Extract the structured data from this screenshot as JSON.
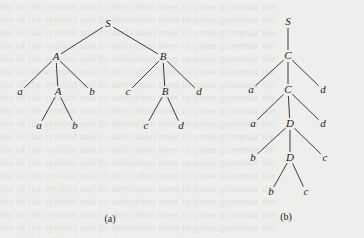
{
  "figure": {
    "trees": [
      {
        "id": "a",
        "caption": "(a)",
        "caption_pos": [
          110,
          213
        ],
        "nodes": [
          {
            "label": "S",
            "x": 108,
            "y": 24
          },
          {
            "label": "A",
            "x": 56,
            "y": 57
          },
          {
            "label": "B",
            "x": 163,
            "y": 57
          },
          {
            "label": "a",
            "x": 20,
            "y": 92
          },
          {
            "label": "A",
            "x": 58,
            "y": 92
          },
          {
            "label": "b",
            "x": 92,
            "y": 92
          },
          {
            "label": "c",
            "x": 128,
            "y": 92
          },
          {
            "label": "B",
            "x": 165,
            "y": 92
          },
          {
            "label": "d",
            "x": 199,
            "y": 92
          },
          {
            "label": "a",
            "x": 39,
            "y": 126
          },
          {
            "label": "b",
            "x": 75,
            "y": 126
          },
          {
            "label": "c",
            "x": 146,
            "y": 126
          },
          {
            "label": "d",
            "x": 181,
            "y": 126
          }
        ],
        "edges": [
          [
            0,
            1
          ],
          [
            0,
            2
          ],
          [
            1,
            3
          ],
          [
            1,
            4
          ],
          [
            1,
            5
          ],
          [
            2,
            6
          ],
          [
            2,
            7
          ],
          [
            2,
            8
          ],
          [
            4,
            9
          ],
          [
            4,
            10
          ],
          [
            7,
            11
          ],
          [
            7,
            12
          ]
        ]
      },
      {
        "id": "b",
        "caption": "(b)",
        "caption_pos": [
          286,
          211
        ],
        "nodes": [
          {
            "label": "S",
            "x": 288,
            "y": 22
          },
          {
            "label": "C",
            "x": 288,
            "y": 56
          },
          {
            "label": "a",
            "x": 251,
            "y": 90
          },
          {
            "label": "C",
            "x": 288,
            "y": 90
          },
          {
            "label": "d",
            "x": 323,
            "y": 90
          },
          {
            "label": "a",
            "x": 253,
            "y": 124
          },
          {
            "label": "D",
            "x": 290,
            "y": 124
          },
          {
            "label": "d",
            "x": 323,
            "y": 124
          },
          {
            "label": "b",
            "x": 253,
            "y": 158
          },
          {
            "label": "D",
            "x": 290,
            "y": 158
          },
          {
            "label": "c",
            "x": 325,
            "y": 158
          },
          {
            "label": "b",
            "x": 271,
            "y": 192
          },
          {
            "label": "c",
            "x": 306,
            "y": 192
          }
        ],
        "edges": [
          [
            0,
            1
          ],
          [
            1,
            2
          ],
          [
            1,
            3
          ],
          [
            1,
            4
          ],
          [
            3,
            5
          ],
          [
            3,
            6
          ],
          [
            3,
            7
          ],
          [
            6,
            8
          ],
          [
            6,
            9
          ],
          [
            6,
            10
          ],
          [
            9,
            11
          ],
          [
            9,
            12
          ]
        ]
      }
    ]
  },
  "colors": {
    "background": "#eeeeec",
    "ink": "#1c1c1c",
    "edge": "#3a3a3a"
  }
}
